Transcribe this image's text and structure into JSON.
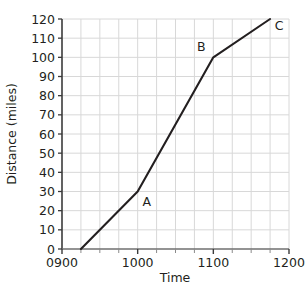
{
  "chart_data": {
    "type": "line",
    "title": "",
    "xlabel": "Time",
    "ylabel": "Distance (miles)",
    "xlim": [
      900,
      1200
    ],
    "ylim": [
      0,
      120
    ],
    "grid": true,
    "legend": "none",
    "x_tick_labels": [
      "0900",
      "1000",
      "1100",
      "1200"
    ],
    "x_tick_values": [
      900,
      1000,
      1100,
      1200
    ],
    "x_gridline_values": [
      925,
      950,
      975,
      1000,
      1025,
      1050,
      1075,
      1100,
      1125,
      1150,
      1175
    ],
    "y_tick_labels": [
      "0",
      "10",
      "20",
      "30",
      "40",
      "50",
      "60",
      "70",
      "80",
      "90",
      "100",
      "110",
      "120"
    ],
    "y_tick_values": [
      0,
      10,
      20,
      30,
      40,
      50,
      60,
      70,
      80,
      90,
      100,
      110,
      120
    ],
    "series": [
      {
        "name": "journey",
        "x": [
          925,
          1000,
          1100,
          1175
        ],
        "y": [
          0,
          30,
          100,
          120
        ]
      }
    ],
    "annotations": [
      {
        "label": "A",
        "x": 1000,
        "y": 30
      },
      {
        "label": "B",
        "x": 1100,
        "y": 100
      },
      {
        "label": "C",
        "x": 1175,
        "y": 120
      }
    ],
    "colors": {
      "line": "#231f20",
      "axis": "#3b3b3b",
      "grid": "#d8d8d8",
      "background": "#ffffff",
      "text": "#231f20"
    }
  }
}
